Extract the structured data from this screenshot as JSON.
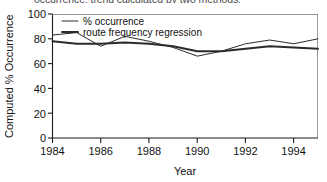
{
  "figure": {
    "clipped_title": "occurrence; trend calculated by two methods.",
    "background": "#ffffff",
    "ink_color": "#2b2b2b"
  },
  "chart_data": {
    "type": "line",
    "title": "",
    "xlabel": "Year",
    "ylabel": "Computed % Occurrence",
    "xlim": [
      1984,
      1995
    ],
    "ylim": [
      0,
      100
    ],
    "grid": false,
    "legend_position": "top-left",
    "xticks": [
      1984,
      1986,
      1988,
      1990,
      1992,
      1994
    ],
    "xticklabels": [
      "1984",
      "1986",
      "1988",
      "1990",
      "1992",
      "1994"
    ],
    "yticks": [
      0,
      20,
      40,
      60,
      80,
      100
    ],
    "yticklabels": [
      "0",
      "20",
      "40",
      "60",
      "80",
      "100"
    ],
    "x": [
      1984,
      1985,
      1986,
      1987,
      1988,
      1989,
      1990,
      1991,
      1992,
      1993,
      1994,
      1995
    ],
    "series": [
      {
        "name": "% occurrence",
        "style": "thin",
        "values": [
          83,
          85,
          74,
          82,
          78,
          73,
          66,
          70,
          76,
          79,
          76,
          80
        ]
      },
      {
        "name": "route frequency regression",
        "style": "thick",
        "values": [
          78,
          76,
          76,
          77,
          76,
          74,
          70,
          70,
          72,
          74,
          73,
          72
        ]
      }
    ]
  },
  "legend": {
    "items": [
      {
        "label": "% occurrence",
        "swatch": "thin-line"
      },
      {
        "label": "route frequency regression",
        "swatch": "thick-line"
      }
    ]
  }
}
